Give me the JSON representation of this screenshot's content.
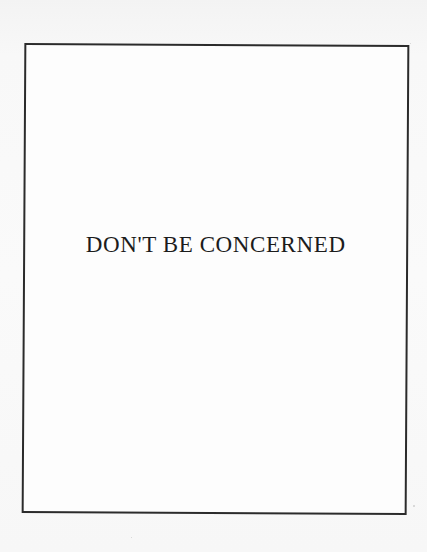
{
  "page": {
    "type": "scanned book page",
    "section_title": "DON'T BE CONCERNED"
  },
  "colors": {
    "background": "#f6f6f6",
    "frame_fill": "#fdfdfd",
    "frame_border": "#2b2b2b",
    "text": "#1c1c1c"
  }
}
